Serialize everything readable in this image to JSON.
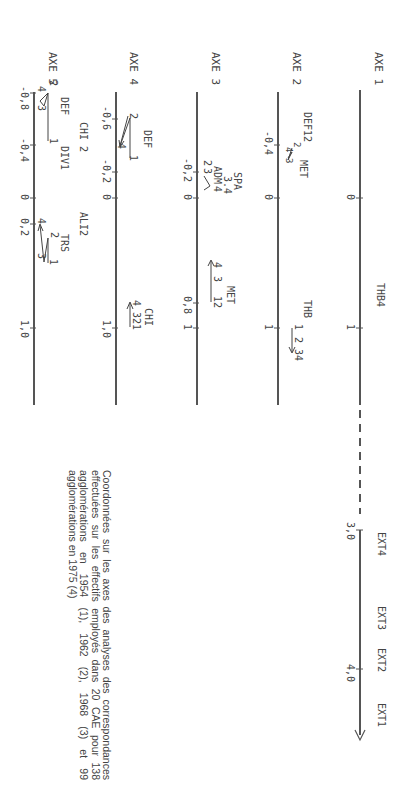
{
  "axes": [
    {
      "label": "AXE 1",
      "ticks": [
        "0",
        "1"
      ],
      "points": [
        "THB4"
      ],
      "extension": {
        "ticks": [
          "3,0",
          "4,0"
        ],
        "points": [
          "EXT4",
          "EXT3",
          "EXT2",
          "EXT1"
        ]
      }
    },
    {
      "label": "AXE 2",
      "ticks": [
        "-0,4",
        "0",
        "1"
      ],
      "points": [
        "DEF12",
        "MET",
        "2",
        "4",
        "3",
        "THB",
        "1",
        "2",
        "34"
      ]
    },
    {
      "label": "AXE 3",
      "ticks": [
        "-0,2",
        "0",
        "0,8",
        "1"
      ],
      "points": [
        "SPA",
        "3.4",
        "ADM",
        "2",
        "3",
        "4",
        "MET",
        "4",
        "3",
        "12"
      ]
    },
    {
      "label": "AXE 4",
      "ticks": [
        "-0,6",
        "-0,2",
        "0",
        "1,0"
      ],
      "points": [
        "DEF",
        "2",
        "4",
        "1",
        "CHI",
        "4",
        "321"
      ]
    },
    {
      "label": "AXE 5",
      "ticks": [
        "-0,8",
        "-0,4",
        "0",
        "0,2",
        "1,0"
      ],
      "points": [
        "2",
        "4",
        "3",
        "DEF",
        "1",
        "CHI 2",
        "DIV1",
        "ALI2",
        "TRS",
        "2",
        "4",
        "3",
        "1"
      ]
    }
  ],
  "caption": "Coordonnées sur les axes des analyses des correspondances effectuées sur les effectifs employés dans 20 CAE pour 138 agglomérations en 1954 (1), 1962 (2), 1968 (3) et 99 agglomérations en 1975 (4)"
}
